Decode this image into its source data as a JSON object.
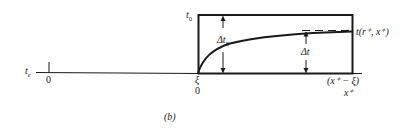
{
  "figure": {
    "caption": "(b)",
    "axis": {
      "left_label_main": "t",
      "left_label_sub": "e",
      "origin_tick_label": "0"
    },
    "rectangle": {
      "top_label_main": "t",
      "top_label_sub": "0"
    },
    "annotations": {
      "delta_t0_main": "Δt",
      "delta_t0_sub": "0",
      "delta_t": "Δt",
      "curve_end_label": "t(r⁺, x⁺)"
    },
    "x_labels": {
      "xi": "ξ",
      "xi_zero": "0",
      "x_minus_xi": "(x⁺ − ξ)",
      "x_plus": "x⁺"
    },
    "colors": {
      "ink": "#1a1a1a",
      "background": "#ffffff"
    }
  }
}
